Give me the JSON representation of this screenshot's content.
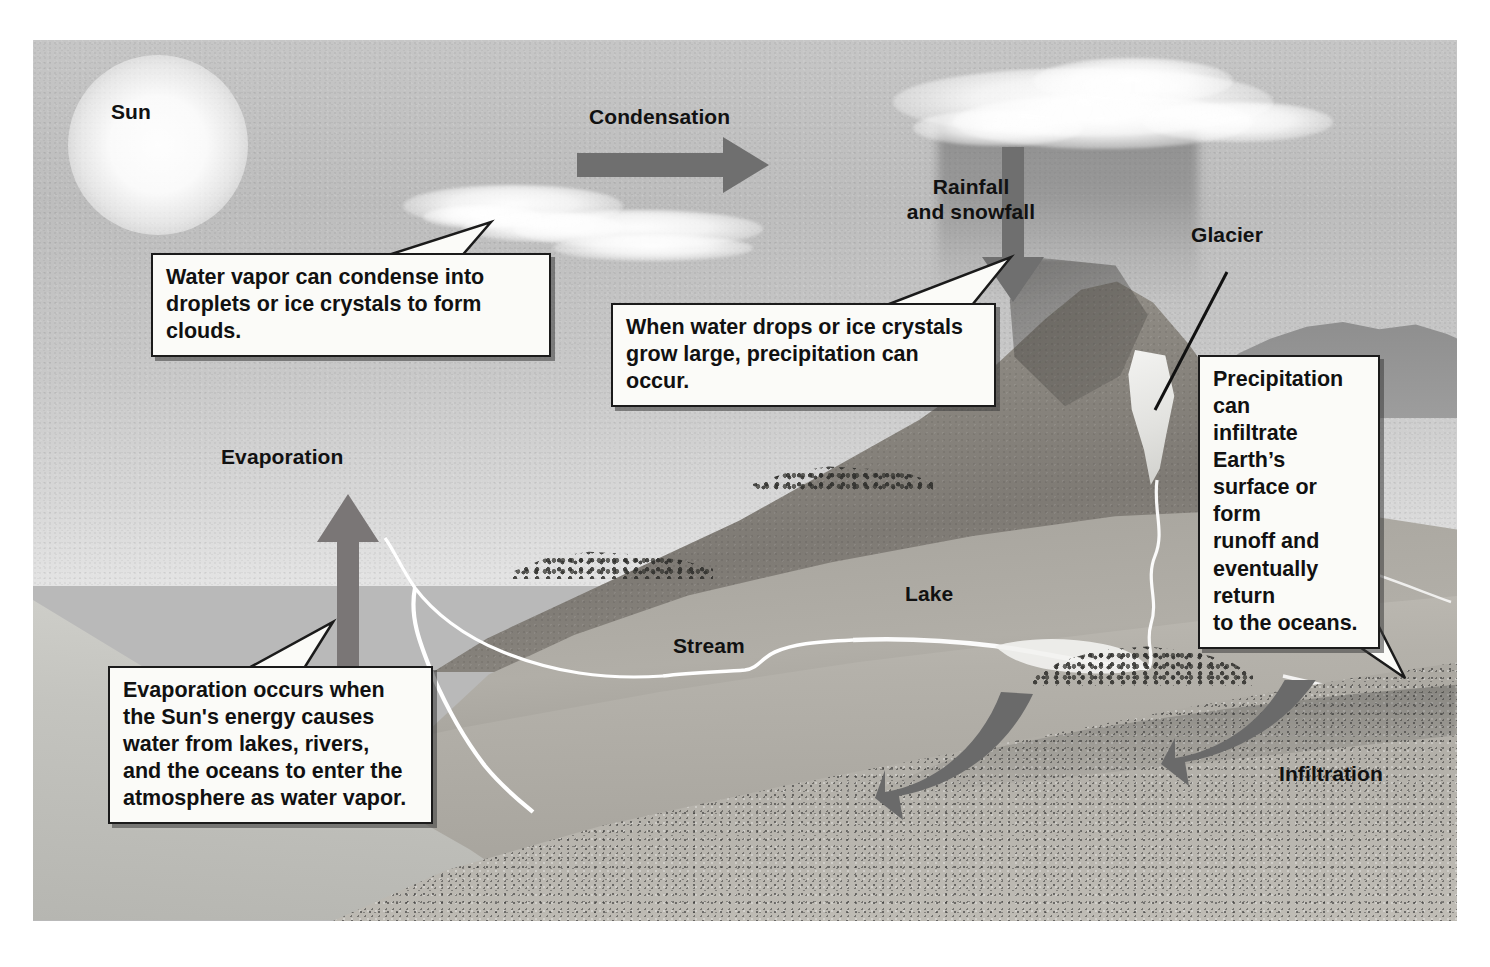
{
  "diagram": {
    "type": "water-cycle-illustration",
    "palette": {
      "sky": "#c2c2c2",
      "land": "#ada9a2",
      "mountain": "#8b8781",
      "arrow_gray": "#6f6f6f",
      "callout_fill": "#fbfbf8",
      "callout_border": "#1b1b1b",
      "text": "#111111",
      "glacier_white": "#f0f0ee",
      "water_white": "#ffffff"
    }
  },
  "labels": {
    "sun": "Sun",
    "condensation": "Condensation",
    "rainfall_snowfall": "Rainfall\nand snowfall",
    "glacier": "Glacier",
    "evaporation": "Evaporation",
    "lake": "Lake",
    "stream": "Stream",
    "infiltration": "Infiltration"
  },
  "callouts": {
    "condensation_note": "Water vapor can condense into\ndroplets or ice crystals to form clouds.",
    "precipitation_note": "When water drops or ice crystals\ngrow large, precipitation can occur.",
    "runoff_note": "Precipitation can\ninfiltrate Earth’s\nsurface or form\nrunoff and\neventually return\nto the oceans.",
    "evaporation_note": "Evaporation occurs when\nthe Sun's energy causes\nwater from lakes,  rivers,\nand the oceans to enter the\natmosphere as water vapor."
  },
  "arrows": {
    "condensation_direction": "right",
    "precipitation_direction": "down",
    "evaporation_direction": "up",
    "infiltration_direction": "curved-left",
    "infiltration_count": 2
  },
  "scene_elements": [
    "sun-glow",
    "wispy-clouds",
    "storm-cloud",
    "rain-shaft",
    "mountain-peak",
    "glacier-patch",
    "meltwater-stream",
    "lake",
    "stream",
    "tree-clusters",
    "ocean",
    "underground-layer"
  ]
}
